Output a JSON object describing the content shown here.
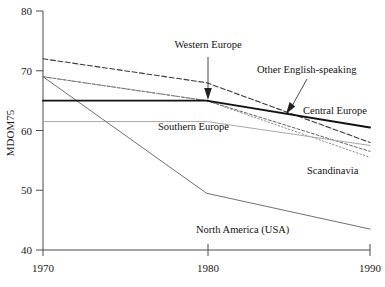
{
  "chart_data": {
    "type": "line",
    "title": "",
    "xlabel": "",
    "ylabel": "MDOM75",
    "x": [
      1970,
      1980,
      1990
    ],
    "xticklabels": [
      "1970",
      "1980",
      "1990"
    ],
    "yticklabels": [
      "40",
      "50",
      "60",
      "70",
      "80"
    ],
    "yticks": [
      40,
      50,
      60,
      70,
      80
    ],
    "xlim": [
      1970,
      1990
    ],
    "ylim": [
      40,
      80
    ],
    "grid": false,
    "legend": "inline-labels",
    "series": [
      {
        "name": "Other English-speaking",
        "values": [
          72,
          68,
          58
        ],
        "style": "dashed",
        "color": "#3a3a3a",
        "width": 1.1
      },
      {
        "name": "Western Europe",
        "values": [
          69,
          65,
          56.5
        ],
        "style": "dashed-fine",
        "color": "#555555",
        "width": 0.9
      },
      {
        "name": "Central Europe",
        "values": [
          65,
          65,
          60.5
        ],
        "style": "solid-bold",
        "color": "#111111",
        "width": 1.9
      },
      {
        "name": "Southern Europe",
        "values": [
          61.5,
          61.5,
          57.5
        ],
        "style": "solid-light",
        "color": "#a8a8a8",
        "width": 1.0
      },
      {
        "name": "Scandinavia",
        "values": [
          69,
          65,
          55.5
        ],
        "style": "dotted",
        "color": "#8a8a8a",
        "width": 1.0
      },
      {
        "name": "North America (USA)",
        "values": [
          69,
          49.5,
          43.5
        ],
        "style": "solid-thin",
        "color": "#707070",
        "width": 1.0
      }
    ],
    "annotations": [
      {
        "label": "Western Europe",
        "arrow": "down",
        "target_year": 1980,
        "target_value": 65.5
      },
      {
        "label": "Other English-speaking",
        "arrow": "down-left",
        "target_year": 1984.8,
        "target_value": 63.3
      },
      {
        "label": "Central Europe",
        "arrow": "none"
      },
      {
        "label": "Southern Europe",
        "arrow": "none"
      },
      {
        "label": "Scandinavia",
        "arrow": "none"
      },
      {
        "label": "North America (USA)",
        "arrow": "none"
      }
    ]
  },
  "axis": {
    "y_title": "MDOM75",
    "y_ticks": [
      "80",
      "70",
      "60",
      "50",
      "40"
    ],
    "x_ticks": [
      "1970",
      "1980",
      "1990"
    ]
  },
  "labels": {
    "western_europe": "Western Europe",
    "other_english_speaking": "Other English-speaking",
    "central_europe": "Central Europe",
    "southern_europe": "Southern Europe",
    "scandinavia": "Scandinavia",
    "north_america": "North America (USA)"
  }
}
